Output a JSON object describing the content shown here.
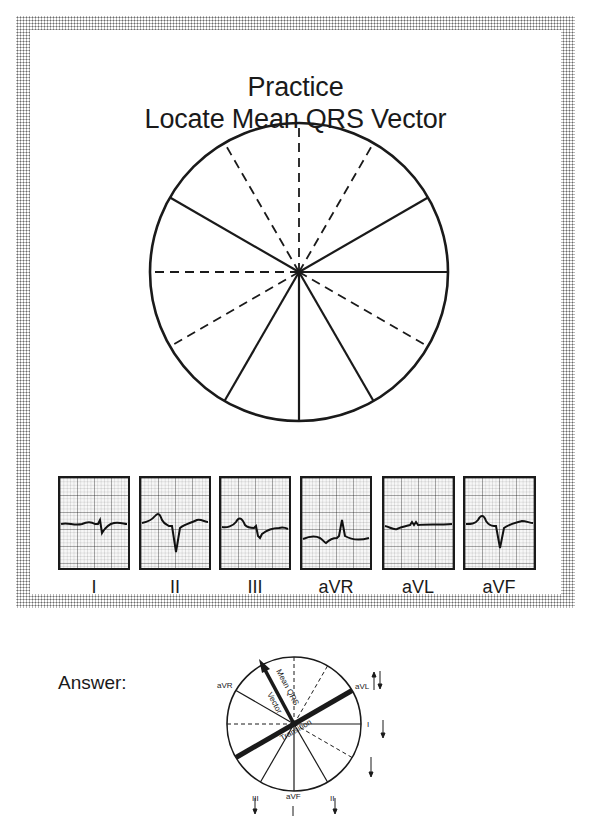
{
  "title": {
    "line1": "Practice",
    "line2": "Locate Mean QRS Vector"
  },
  "practice_wheel": {
    "solid_spokes_deg": [
      0,
      30,
      150,
      -60,
      -90,
      -120
    ],
    "dashed_spokes_deg": [
      90,
      60,
      120,
      180,
      -30,
      -150
    ]
  },
  "ecg_leads": [
    {
      "label": "I",
      "pattern": "small negative deflection (rS)"
    },
    {
      "label": "II",
      "pattern": "deep negative QRS"
    },
    {
      "label": "III",
      "pattern": "negative QRS"
    },
    {
      "label": "aVR",
      "pattern": "positive R wave"
    },
    {
      "label": "aVL",
      "pattern": "nearly flat / equiphasic"
    },
    {
      "label": "aVF",
      "pattern": "deep negative QRS"
    }
  ],
  "answer": {
    "label": "Answer:",
    "lead_labels": {
      "aVR": "aVR",
      "aVL": "aVL",
      "I": "I",
      "II": "II",
      "III": "III",
      "aVF": "aVF"
    },
    "vector_label_line1": "Mean QRS",
    "vector_label_line2": "Vector",
    "transition_label": "Transition",
    "arrows": {
      "aVL": "up-down (equiphasic)",
      "I": "down",
      "dashed_lower_right": "down",
      "II": "down",
      "aVF": "down",
      "III": "down"
    }
  }
}
